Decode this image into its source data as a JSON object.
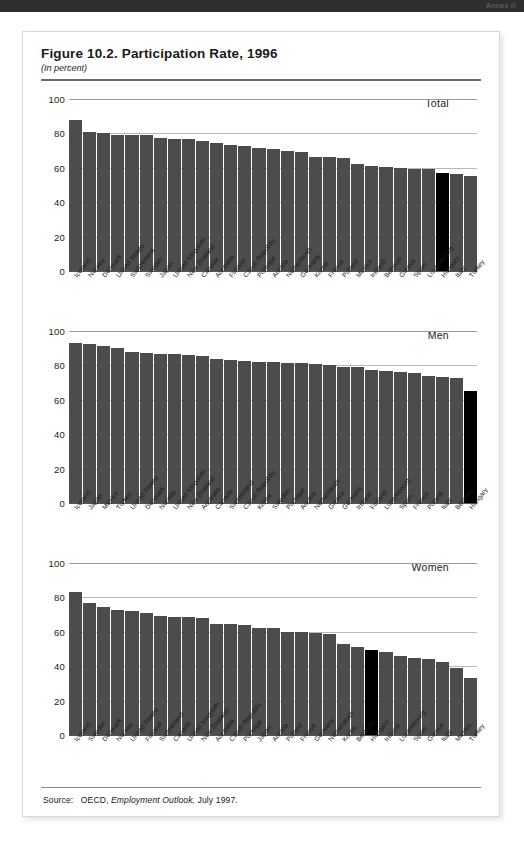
{
  "header": {
    "band_label": "Annex II"
  },
  "figure": {
    "title": "Figure 10.2. Participation Rate, 1996",
    "subtitle": "(In percent)",
    "source_prefix": "Source:",
    "source_org": "OECD,",
    "source_pub": "Employment Outlook,",
    "source_date": "July 1997."
  },
  "chart_data": [
    {
      "type": "bar",
      "title": "Total",
      "xlabel": "",
      "ylabel": "",
      "ylim": [
        0,
        100
      ],
      "yticks": [
        0,
        20,
        40,
        60,
        80,
        100
      ],
      "grid": true,
      "highlight": "Hungary",
      "highlight_color": "#000000",
      "bar_color": "#4c4c4c",
      "categories": [
        "Iceland",
        "Norway",
        "Denmark",
        "United States",
        "Switzerland",
        "Sweden",
        "Japan",
        "United Kingdom",
        "New Zealand",
        "Canada",
        "Australia",
        "Finland",
        "Czech Republic",
        "Portugal",
        "Austria",
        "Netherlands",
        "Germany",
        "Korea",
        "France",
        "Poland",
        "Mexico",
        "Ireland",
        "Belgium",
        "Greece",
        "Spain",
        "Luxembourg",
        "Hungary",
        "Italy",
        "Turkey"
      ],
      "values": [
        88.0,
        81.0,
        80.0,
        79.3,
        79.3,
        79.0,
        77.2,
        77.0,
        76.5,
        75.5,
        74.5,
        73.5,
        72.5,
        71.5,
        71.0,
        69.5,
        69.0,
        66.5,
        66.2,
        65.5,
        62.5,
        61.0,
        60.5,
        60.0,
        59.6,
        59.2,
        57.0,
        56.5,
        55.5
      ]
    },
    {
      "type": "bar",
      "title": "Men",
      "xlabel": "",
      "ylabel": "",
      "ylim": [
        0,
        100
      ],
      "yticks": [
        0,
        20,
        40,
        60,
        80,
        100
      ],
      "grid": true,
      "highlight": "Hungary",
      "highlight_color": "#000000",
      "bar_color": "#4c4c4c",
      "categories": [
        "Iceland",
        "Japan",
        "Mexico",
        "Turkey",
        "United States",
        "Denmark",
        "Norway",
        "United Kingdom",
        "New Zealand",
        "Australia",
        "Canada",
        "Switzerland",
        "Czech Republic",
        "Korea",
        "Sweden",
        "Portugal",
        "Austria",
        "Netherlands",
        "Greece",
        "Germany",
        "Ireland",
        "Finland",
        "Luxembourg",
        "Spain",
        "France",
        "Poland",
        "Italy",
        "Belgium",
        "Hungary"
      ],
      "values": [
        93.0,
        92.2,
        91.2,
        90.0,
        88.0,
        87.0,
        86.8,
        86.7,
        86.2,
        85.5,
        83.5,
        83.4,
        82.5,
        82.0,
        81.8,
        81.5,
        81.3,
        80.8,
        80.2,
        79.0,
        78.8,
        77.5,
        77.0,
        76.0,
        75.6,
        74.0,
        73.0,
        72.8,
        65.0
      ]
    },
    {
      "type": "bar",
      "title": "Women",
      "xlabel": "",
      "ylabel": "",
      "ylim": [
        0,
        100
      ],
      "yticks": [
        0,
        20,
        40,
        60,
        80,
        100
      ],
      "grid": true,
      "highlight": "Hungary",
      "highlight_color": "#000000",
      "bar_color": "#4c4c4c",
      "categories": [
        "Iceland",
        "Sweden",
        "Denmark",
        "Norway",
        "United States",
        "Finland",
        "Switzerland",
        "Canada",
        "United Kingdom",
        "New Zealand",
        "Australia",
        "Czech Republic",
        "Portugal",
        "Japan",
        "Austria",
        "Poland",
        "France",
        "Germany",
        "Netherlands",
        "Korea",
        "Belgium",
        "Hungary",
        "Ireland",
        "Luxembourg",
        "Spain",
        "Greece",
        "Italy",
        "Mexico",
        "Turkey"
      ],
      "values": [
        83.0,
        76.5,
        74.5,
        72.5,
        72.3,
        71.0,
        69.0,
        68.8,
        68.5,
        68.0,
        64.5,
        64.3,
        64.0,
        62.5,
        62.0,
        60.0,
        59.8,
        59.5,
        59.0,
        53.0,
        51.0,
        49.5,
        48.0,
        46.0,
        44.5,
        44.0,
        42.5,
        39.0,
        33.0
      ]
    }
  ]
}
